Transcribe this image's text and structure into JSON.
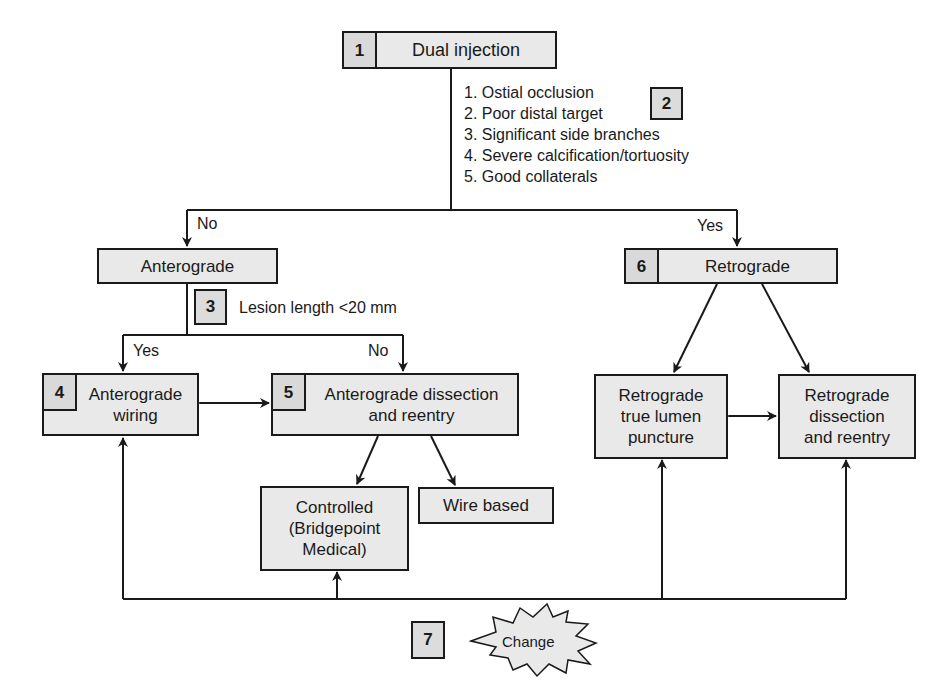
{
  "diagram": {
    "colors": {
      "box_fill": "#e9e9e9",
      "number_fill": "#d9d9d9",
      "line": "#1a1a1a",
      "background": "#ffffff"
    },
    "nodes": {
      "dual_injection": {
        "number": "1",
        "label": "Dual injection"
      },
      "criteria": {
        "number": "2",
        "items": [
          "1. Ostial occlusion",
          "2. Poor distal target",
          "3. Significant side branches",
          "4. Severe calcification/tortuosity",
          "5. Good collaterals"
        ]
      },
      "anterograde": {
        "label": "Anterograde"
      },
      "lesion_length": {
        "number": "3",
        "label": "Lesion length <20 mm"
      },
      "anterograde_wiring": {
        "number": "4",
        "line1": "Anterograde",
        "line2": "wiring"
      },
      "anterograde_dissection": {
        "number": "5",
        "line1": "Anterograde dissection",
        "line2": "and reentry"
      },
      "controlled": {
        "line1": "Controlled",
        "line2": "(Bridgepoint",
        "line3": "Medical)"
      },
      "wire_based": {
        "label": "Wire based"
      },
      "retrograde": {
        "number": "6",
        "label": "Retrograde"
      },
      "retro_true_lumen": {
        "line1": "Retrograde",
        "line2": "true lumen",
        "line3": "puncture"
      },
      "retro_dissection": {
        "line1": "Retrograde",
        "line2": "dissection",
        "line3": "and reentry"
      },
      "change": {
        "number": "7",
        "label": "Change"
      }
    },
    "edge_labels": {
      "no_left": "No",
      "yes_right": "Yes",
      "yes_wiring": "Yes",
      "no_dissection": "No"
    }
  }
}
